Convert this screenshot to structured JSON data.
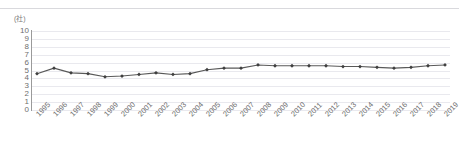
{
  "unit_label": "(社)",
  "chart_data": {
    "type": "line",
    "title": "",
    "subtitle": "",
    "xlabel": "",
    "ylabel": "(社)",
    "ylim": [
      0,
      10
    ],
    "ytick_step": 1,
    "yticks": [
      "10",
      "9",
      "8",
      "7",
      "6",
      "5",
      "4",
      "3",
      "2",
      "1",
      "0"
    ],
    "grid": true,
    "grid_axis": "y",
    "legend": "none",
    "marker": "diamond",
    "line_color": "#595959",
    "marker_color": "#3f3f3f",
    "grid_color": "#e9e9ee",
    "axis_color": "#9a9a9a",
    "categories": [
      "1995",
      "1996",
      "1997",
      "1998",
      "1999",
      "2000",
      "2001",
      "2002",
      "2003",
      "2004",
      "2005",
      "2006",
      "2007",
      "2008",
      "2009",
      "2010",
      "2011",
      "2012",
      "2013",
      "2014",
      "2015",
      "2016",
      "2017",
      "2018",
      "2019"
    ],
    "values": [
      4.6,
      5.3,
      4.7,
      4.6,
      4.2,
      4.3,
      4.5,
      4.7,
      4.5,
      4.6,
      5.1,
      5.3,
      5.3,
      5.7,
      5.6,
      5.6,
      5.6,
      5.6,
      5.5,
      5.5,
      5.4,
      5.3,
      5.4,
      5.6,
      5.7
    ],
    "series": [
      {
        "name": "",
        "values": [
          4.6,
          5.3,
          4.7,
          4.6,
          4.2,
          4.3,
          4.5,
          4.7,
          4.5,
          4.6,
          5.1,
          5.3,
          5.3,
          5.7,
          5.6,
          5.6,
          5.6,
          5.6,
          5.5,
          5.5,
          5.4,
          5.3,
          5.4,
          5.6,
          5.7
        ]
      }
    ]
  }
}
